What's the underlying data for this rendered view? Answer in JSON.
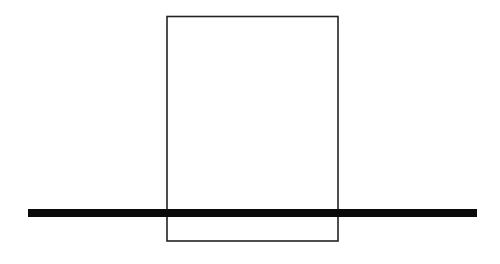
{
  "diagram": {
    "background": "#ffffff",
    "rectangle": {
      "x": 167,
      "y": 16.5,
      "width": 171,
      "height": 224.5,
      "stroke": "#222222",
      "stroke_width": 1.6,
      "fill": "none"
    },
    "bar": {
      "x1": 28,
      "x2": 477,
      "y": 213,
      "thickness": 8,
      "color": "#0a0a0a"
    }
  }
}
